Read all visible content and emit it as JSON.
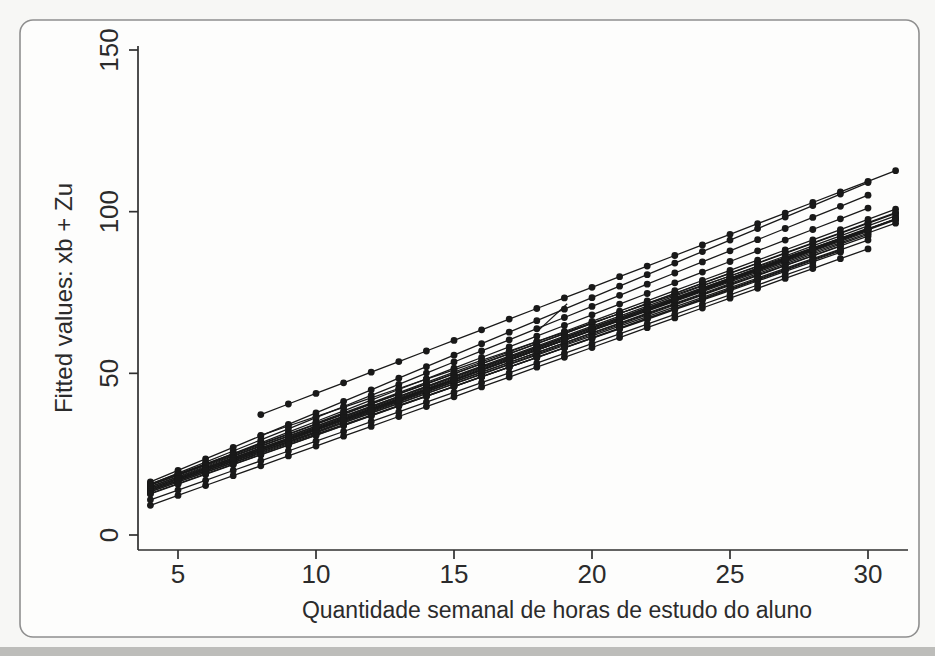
{
  "page": {
    "background": "#f7f7f5",
    "scan_band_color": "#bdbdba"
  },
  "frame": {
    "border_color": "#8f8f8f",
    "fill": "#fdfdfc"
  },
  "chart_data": {
    "type": "line",
    "title": "",
    "xlabel": "Quantidade semanal de horas de estudo do aluno",
    "ylabel": "Fitted values: xb + Zu",
    "xlim": [
      3.5,
      31.6
    ],
    "ylim": [
      -5,
      155
    ],
    "x_ticks": [
      5,
      10,
      15,
      20,
      25,
      30
    ],
    "y_ticks": [
      0,
      50,
      100,
      150
    ],
    "y_tick_rotation": 90,
    "grid": false,
    "legend": "none",
    "marker": "filled-circle",
    "ink_color": "#191919",
    "axis_color": "#2f2f2f",
    "n_groups": 26,
    "series_rule": "for each series, markers at every integer x from x0 to x1 with y = a + b*x (straight fitted lines)",
    "series": [
      {
        "name": "g1",
        "a": 11.0,
        "b": 3.28,
        "x0": 8,
        "x1": 31
      },
      {
        "name": "g2",
        "a": 2.2,
        "b": 3.56,
        "x0": 4,
        "x1": 30
      },
      {
        "name": "g3",
        "a": 1.9,
        "b": 3.44,
        "x0": 4,
        "x1": 30
      },
      {
        "name": "g4",
        "a": 2.1,
        "b": 3.3,
        "x0": 5,
        "x1": 30
      },
      {
        "name": "g5",
        "a": 7.6,
        "b": 2.9,
        "x0": 8,
        "x1": 30
      },
      {
        "name": "g6",
        "a": 3.4,
        "b": 3.1,
        "x0": 4,
        "x1": 31
      },
      {
        "name": "g7",
        "a": 3.0,
        "b": 3.12,
        "x0": 4,
        "x1": 31
      },
      {
        "name": "g8",
        "a": 2.6,
        "b": 3.1,
        "x0": 4,
        "x1": 31
      },
      {
        "name": "g9",
        "a": 3.2,
        "b": 3.05,
        "x0": 4,
        "x1": 31
      },
      {
        "name": "g10",
        "a": 2.2,
        "b": 3.08,
        "x0": 4,
        "x1": 31
      },
      {
        "name": "g11",
        "a": 2.8,
        "b": 3.02,
        "x0": 4,
        "x1": 31
      },
      {
        "name": "g12",
        "a": 1.8,
        "b": 3.08,
        "x0": 4,
        "x1": 30
      },
      {
        "name": "g13",
        "a": 2.4,
        "b": 3.0,
        "x0": 4,
        "x1": 30
      },
      {
        "name": "g14",
        "a": 1.5,
        "b": 3.05,
        "x0": 4,
        "x1": 30
      },
      {
        "name": "g15",
        "a": 2.0,
        "b": 2.98,
        "x0": 4,
        "x1": 29
      },
      {
        "name": "g16",
        "a": 1.2,
        "b": 3.04,
        "x0": 4,
        "x1": 29
      },
      {
        "name": "g17",
        "a": 1.6,
        "b": 2.96,
        "x0": 4,
        "x1": 29
      },
      {
        "name": "g18",
        "a": 0.9,
        "b": 3.0,
        "x0": 4,
        "x1": 29
      },
      {
        "name": "g19",
        "a": 2.1,
        "b": 3.06,
        "x0": 5,
        "x1": 30
      },
      {
        "name": "g20",
        "a": 1.4,
        "b": 3.1,
        "x0": 5,
        "x1": 31
      },
      {
        "name": "g21",
        "a": 0.6,
        "b": 3.02,
        "x0": 4,
        "x1": 30
      },
      {
        "name": "g22",
        "a": 3.1,
        "b": 3.15,
        "x0": 10,
        "x1": 31
      },
      {
        "name": "g23",
        "a": 2.5,
        "b": 3.08,
        "x0": 9,
        "x1": 30
      },
      {
        "name": "g24",
        "a": 1.0,
        "b": 3.12,
        "x0": 11,
        "x1": 31
      },
      {
        "name": "g25",
        "a": -3.0,
        "b": 3.05,
        "x0": 4,
        "x1": 30
      },
      {
        "name": "g26",
        "a": -1.2,
        "b": 3.02,
        "x0": 4,
        "x1": 28
      }
    ],
    "stray_segment": [
      [
        18.0,
        62.8
      ],
      [
        19.1,
        71.5
      ]
    ]
  }
}
